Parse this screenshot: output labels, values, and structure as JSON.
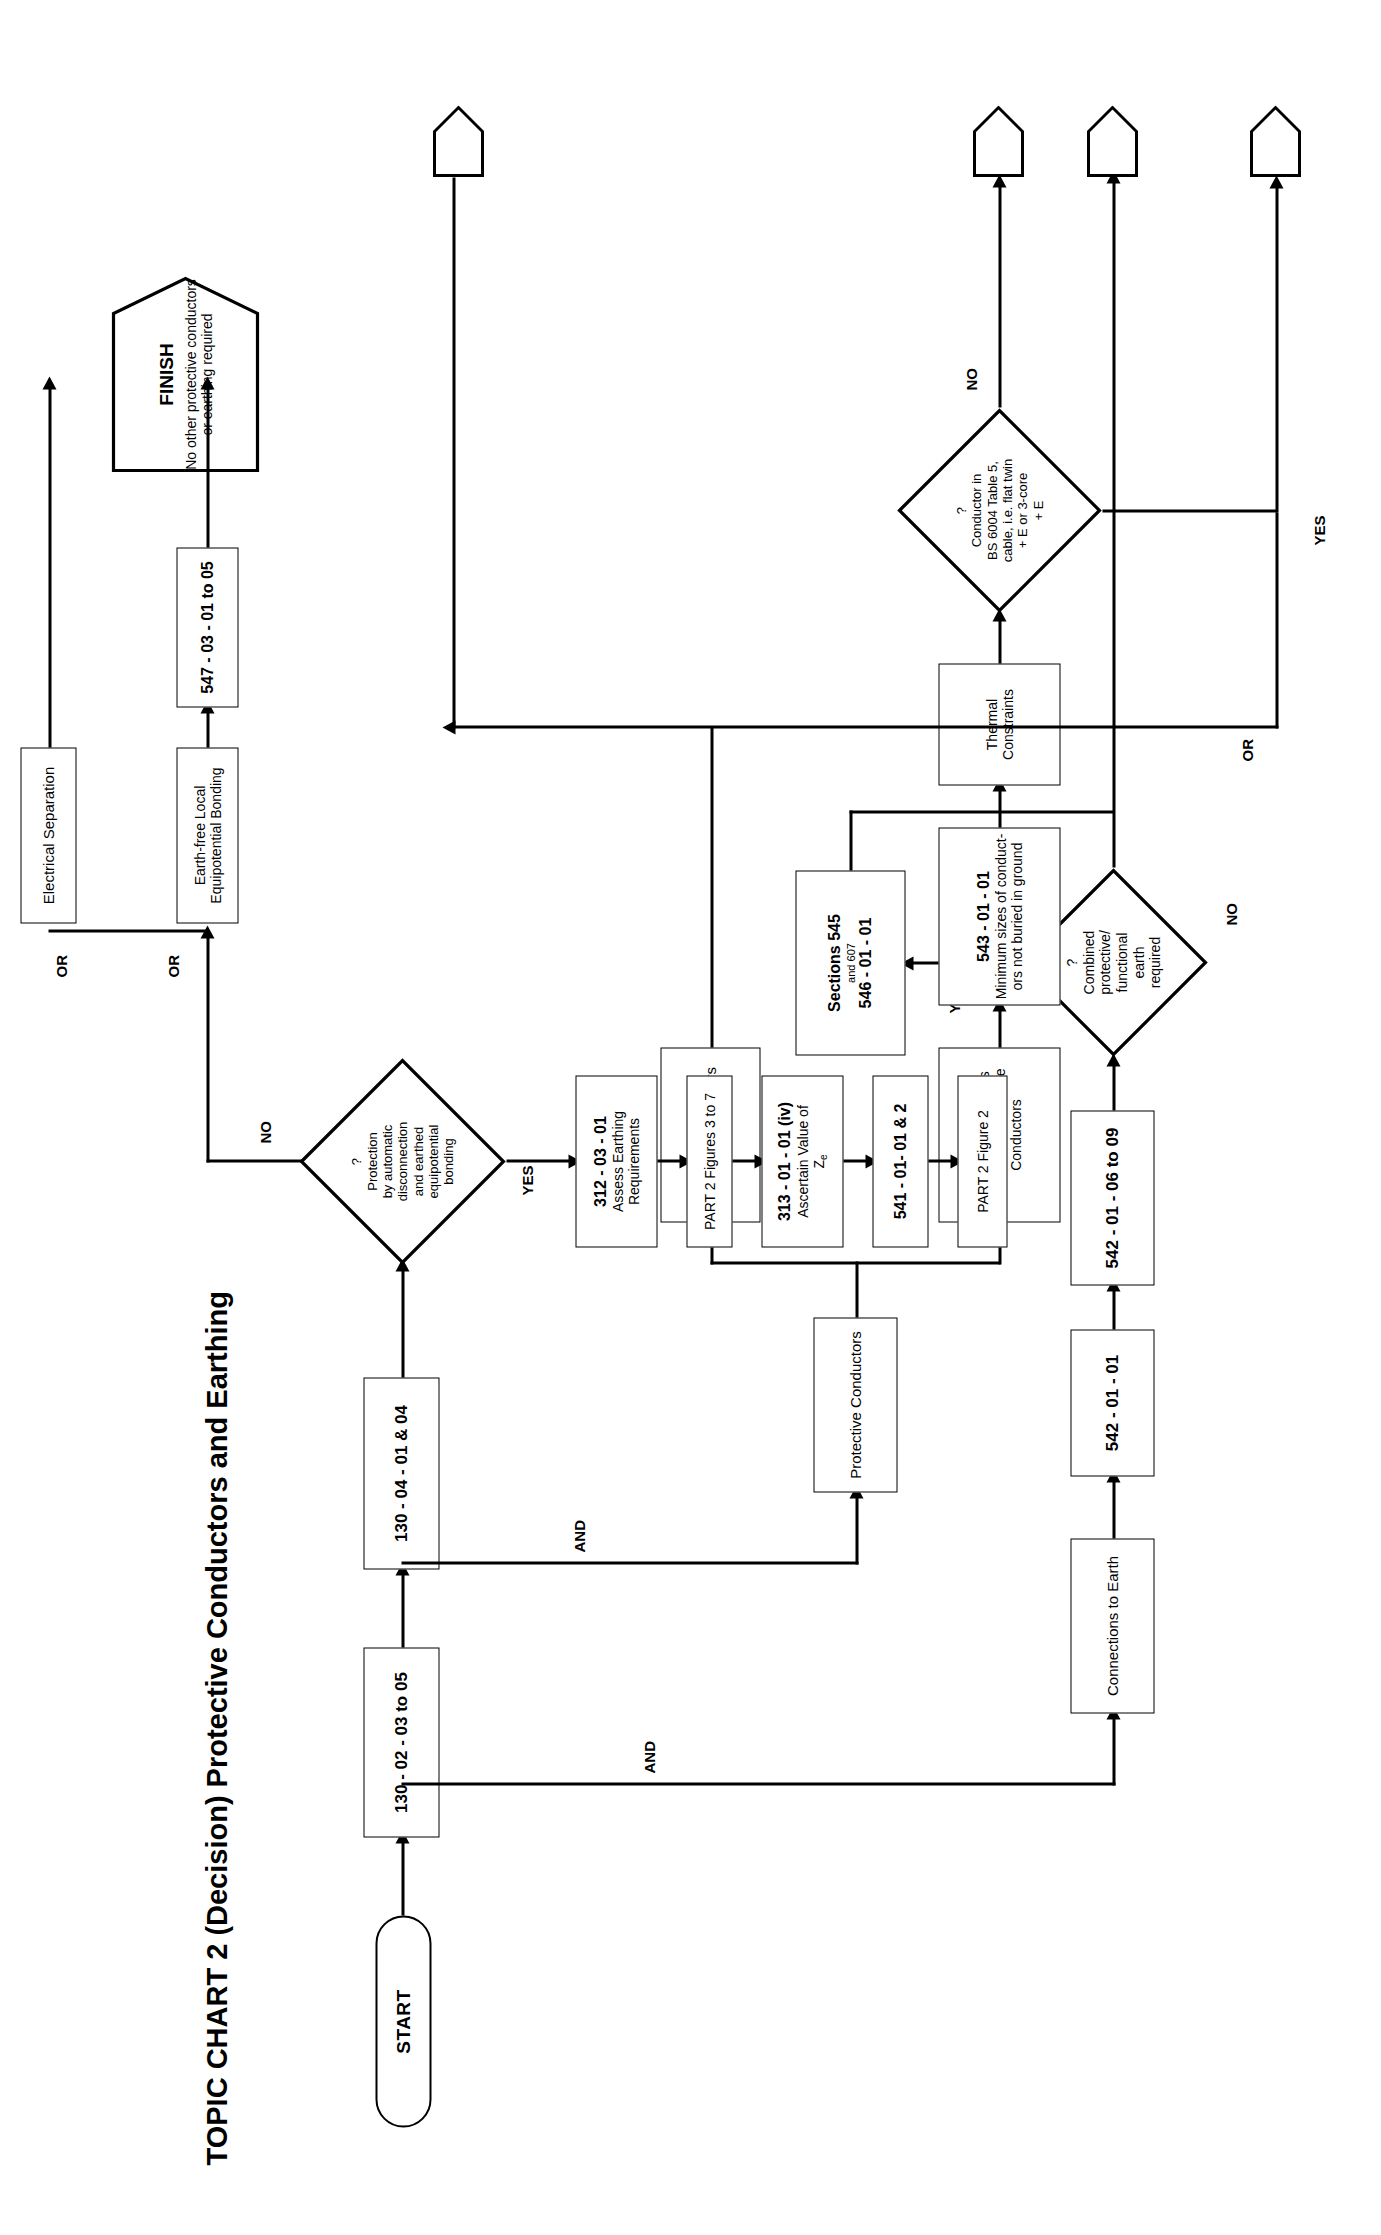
{
  "page": {
    "number_label": "Page 58"
  },
  "title": "TOPIC CHART 2 (Decision) Protective Conductors and Earthing",
  "terminators": {
    "start": "START",
    "finish_title": "FINISH",
    "finish_text": "No other protective conductors or earthing required"
  },
  "spine": {
    "ref_1": "130 - 02 - 03 to 05",
    "ref_2": "130 - 04 - 01 & 04",
    "and_1": "AND",
    "and_2": "AND"
  },
  "branch_connections": {
    "header": "Connections to Earth",
    "ref_1": "542 - 01 - 01",
    "ref_2": "542 - 01 - 06 to 09",
    "decision": {
      "q": "?",
      "l1": "Combined",
      "l2": "protective/",
      "l3": "functional",
      "l4": "earth",
      "l5": "required"
    },
    "yes_label": "YES",
    "no_label": "NO",
    "yes_target": {
      "l1": "Sections 545",
      "l2": "and 607",
      "l3": "546 - 01 - 01"
    }
  },
  "branch_protective": {
    "header": "Protective Conductors",
    "bonding": "Bonding Conductors",
    "earthing_box": {
      "l1": "Earthing Conductors",
      "l2": "and Circuit Protective",
      "l3": "Conductors"
    },
    "ref_543": {
      "l1": "543 - 01 - 01",
      "l2": "Minimum sizes of conduct-",
      "l3": "ors not buried in ground"
    },
    "thermal": "Thermal Constraints",
    "decision": {
      "q": "?",
      "l1": "Conductor in",
      "l2": "BS 6004  Table 5,",
      "l3": "cable, i.e. flat twin",
      "l4": "+ E or 3-core",
      "l5": "+ E"
    },
    "yes_label": "YES",
    "no_label": "NO"
  },
  "branch_decision_main": {
    "decision": {
      "q": "?",
      "l1": "Protection",
      "l2": "by automatic",
      "l3": "disconnection",
      "l4": "and earthed",
      "l5": "equipotential",
      "l6": "bonding"
    },
    "yes_label": "YES",
    "no_label": "NO"
  },
  "yes_chain": [
    {
      "l1": "312 - 03 - 01",
      "l2": "Assess Earthing",
      "l3": "Requirements",
      "bold_first": true
    },
    {
      "l1": "PART 2     Figures 3 to 7",
      "bold_first": false
    },
    {
      "l1": "313 - 01 - 01  (iv)",
      "l2": "Ascertain Value of",
      "l3": "Z",
      "l3sub": "e",
      "bold_first": true
    },
    {
      "l1": "541 - 01- 01 & 2",
      "bold_first": true
    },
    {
      "l1": "PART 2     Figure 2",
      "bold_first": false
    }
  ],
  "no_chain": {
    "or_1": "OR",
    "or_2": "OR",
    "earth_free": {
      "l1": "Earth-free Local",
      "l2": "Equipotential Bonding"
    },
    "earth_free_ref": "547 - 03 - 01 to 05",
    "electrical_sep": "Electrical Separation",
    "electrical_sep_ref": {
      "l1": "413 - 06 - 01 to 05 and",
      "l2": "471 - 12 - 01"
    }
  },
  "off_page": {
    "or_label": "OR"
  },
  "colors": {
    "ink": "#000000",
    "paper": "#ffffff"
  }
}
